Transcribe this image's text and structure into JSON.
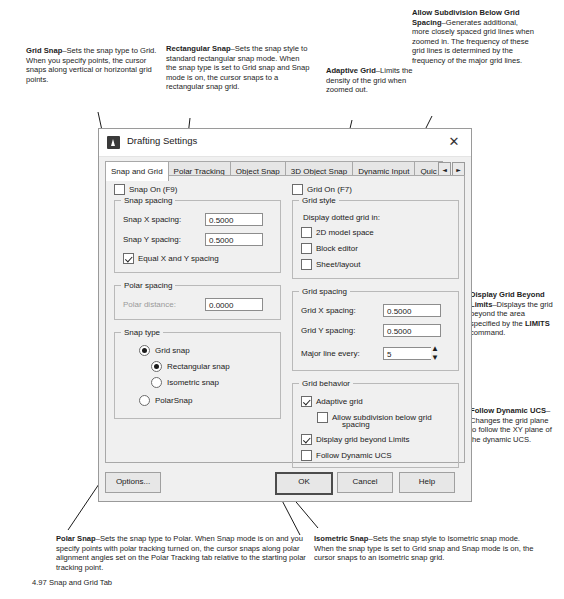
{
  "figure_caption": "4.97  Snap and Grid Tab",
  "dialog": {
    "title": "Drafting Settings",
    "app_icon": "autocad-icon",
    "close_icon": "close-icon",
    "tabs": [
      {
        "label": "Snap and Grid",
        "active": true
      },
      {
        "label": "Polar Tracking",
        "active": false
      },
      {
        "label": "Object Snap",
        "active": false
      },
      {
        "label": "3D Object Snap",
        "active": false
      },
      {
        "label": "Dynamic Input",
        "active": false
      },
      {
        "label": "Quic",
        "active": false
      }
    ],
    "tab_nav": {
      "prev": "◄",
      "next": "►"
    },
    "left": {
      "snap_on": {
        "label": "Snap On (F9)",
        "checked": false
      },
      "snap_spacing": {
        "legend": "Snap spacing",
        "x_label": "Snap X spacing:",
        "x_value": "0.5000",
        "y_label": "Snap Y spacing:",
        "y_value": "0.5000",
        "equal_label": "Equal X and Y spacing",
        "equal_checked": true
      },
      "polar_spacing": {
        "legend": "Polar spacing",
        "distance_label": "Polar distance:",
        "distance_value": "0.0000"
      },
      "snap_type": {
        "legend": "Snap type",
        "grid_snap": {
          "label": "Grid snap",
          "selected": true
        },
        "rectangular_snap": {
          "label": "Rectangular snap",
          "selected": true
        },
        "isometric_snap": {
          "label": "Isometric snap",
          "selected": false
        },
        "polar_snap": {
          "label": "PolarSnap",
          "selected": false
        }
      }
    },
    "right": {
      "grid_on": {
        "label": "Grid On (F7)",
        "checked": false
      },
      "grid_style": {
        "legend": "Grid style",
        "subtext": "Display dotted grid in:",
        "model_space": {
          "label": "2D model space",
          "checked": false
        },
        "block_editor": {
          "label": "Block editor",
          "checked": false
        },
        "sheet_layout": {
          "label": "Sheet/layout",
          "checked": false
        }
      },
      "grid_spacing": {
        "legend": "Grid spacing",
        "x_label": "Grid X spacing:",
        "x_value": "0.5000",
        "y_label": "Grid Y spacing:",
        "y_value": "0.5000",
        "major_label": "Major line every:",
        "major_value": "5",
        "spin_up": "▲",
        "spin_down": "▼"
      },
      "grid_behavior": {
        "legend": "Grid behavior",
        "adaptive": {
          "label": "Adaptive grid",
          "checked": true
        },
        "allow_sub": {
          "label": "Allow subdivision below grid",
          "label2": "spacing",
          "checked": false
        },
        "display_beyond": {
          "label": "Display grid beyond Limits",
          "checked": true
        },
        "follow_ucs": {
          "label": "Follow Dynamic UCS",
          "checked": false
        }
      }
    },
    "buttons": {
      "options": "Options...",
      "ok": "OK",
      "cancel": "Cancel",
      "help": "Help"
    }
  },
  "callouts": {
    "grid_snap": {
      "term": "Grid Snap",
      "body": "–Sets the snap type to Grid. When you specify points, the cursor snaps along vertical or horizontal grid points."
    },
    "rectangular_snap": {
      "term": "Rectangular Snap",
      "body": "–Sets the snap style to standard rectangular snap mode. When the snap type is set to Grid snap and Snap mode is on, the cursor snaps to a rectangular snap grid."
    },
    "adaptive_grid": {
      "term": "Adaptive Grid",
      "body": "–Limits the density of the grid when zoomed out."
    },
    "allow_subdivision": {
      "term": "Allow Subdivision Below Grid Spacing",
      "body": "–Generates additional, more closely spaced grid lines when zoomed in. The frequency of these grid lines is determined by the frequency of the major grid lines."
    },
    "display_grid_beyond": {
      "term": "Display Grid Beyond Limits",
      "body": "–Displays the grid beyond the area specified by the ",
      "bold_tail": "LIMITS",
      "tail": " command."
    },
    "follow_dynamic_ucs": {
      "term": "Follow Dynamic UCS",
      "body": "–Changes the grid plane to follow the XY plane of the dynamic UCS."
    },
    "polar_snap": {
      "term": "Polar Snap",
      "body": "–Sets the snap type to Polar. When Snap mode is on and you specify points with polar tracking turned on, the cursor snaps along polar alignment angles set on the Polar Tracking tab relative to the starting polar tracking point."
    },
    "isometric_snap": {
      "term": "Isometric Snap",
      "body": "–Sets the snap style to Isometric snap mode. When the snap type is set to Grid snap and Snap mode is on, the cursor snaps to an isometric snap grid."
    }
  }
}
